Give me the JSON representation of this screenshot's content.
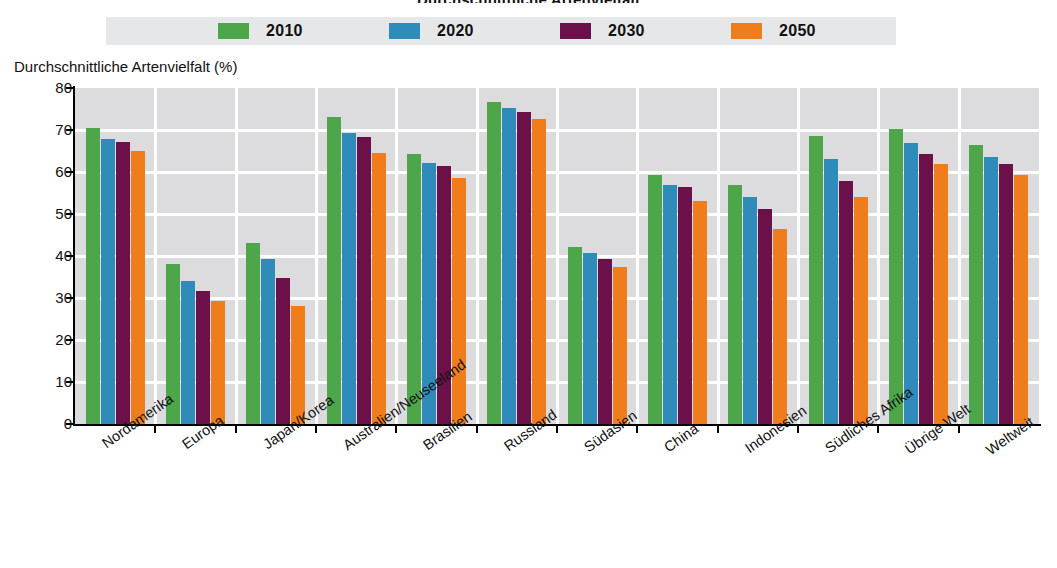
{
  "title": "Durchschnittliche Artenvielfalt",
  "axis_title": "Durchschnittliche Artenvielfalt (%)",
  "legend": {
    "items": [
      {
        "label": "2010",
        "color": "#4ea64b"
      },
      {
        "label": "2020",
        "color": "#2f8cba"
      },
      {
        "label": "2030",
        "color": "#6b1049"
      },
      {
        "label": "2050",
        "color": "#f07d1b"
      }
    ]
  },
  "y_axis": {
    "label": "Durchschnittliche Artenvielfalt (%)",
    "ticks": [
      "0",
      "10",
      "20",
      "30",
      "40",
      "50",
      "60",
      "70",
      "80"
    ],
    "min": 0,
    "max": 80,
    "step": 10
  },
  "chart_data": {
    "type": "bar",
    "title": "Durchschnittliche Artenvielfalt",
    "xlabel": "",
    "ylabel": "Durchschnittliche Artenvielfalt (%)",
    "ylim": [
      0,
      80
    ],
    "grid": true,
    "legend_position": "top",
    "categories": [
      "Nordamerika",
      "Europa",
      "Japan/Korea",
      "Australien/Neuseeland",
      "Brasilien",
      "Russland",
      "Südasien",
      "China",
      "Indonesien",
      "Südliches Afrika",
      "Übrige Welt",
      "Weltweit"
    ],
    "series": [
      {
        "name": "2010",
        "color": "#4ea64b",
        "values": [
          70.5,
          38.2,
          43.1,
          73.0,
          64.3,
          76.6,
          42.2,
          59.4,
          57.0,
          68.6,
          70.2,
          66.4
        ]
      },
      {
        "name": "2020",
        "color": "#2f8cba",
        "values": [
          67.9,
          34.0,
          39.4,
          69.2,
          62.2,
          75.2,
          40.6,
          56.8,
          54.1,
          63.2,
          66.8,
          63.6
        ]
      },
      {
        "name": "2030",
        "color": "#6b1049",
        "values": [
          67.2,
          31.7,
          34.8,
          68.4,
          61.4,
          74.2,
          39.3,
          56.5,
          51.1,
          57.8,
          64.2,
          61.8
        ]
      },
      {
        "name": "2050",
        "color": "#f07d1b",
        "values": [
          65.0,
          29.3,
          28.1,
          64.6,
          58.6,
          72.6,
          37.3,
          53.0,
          46.5,
          54.1,
          61.9,
          59.2
        ]
      }
    ]
  }
}
